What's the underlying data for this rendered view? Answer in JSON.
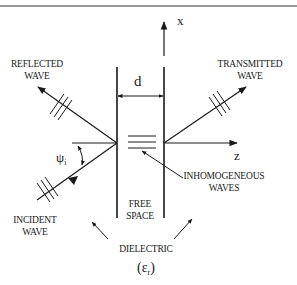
{
  "diagram": {
    "type": "wave-transmission-through-free-space-slab",
    "axes": {
      "x": "x",
      "z": "z"
    },
    "slab_width_label": "d",
    "labels": {
      "reflected": [
        "REFLECTED",
        "WAVE"
      ],
      "transmitted": [
        "TRANSMITTED",
        "WAVE"
      ],
      "incident": [
        "INCIDENT",
        "WAVE"
      ],
      "inhomogeneous": [
        "INHOMOGENEOUS",
        "WAVES"
      ],
      "free_space": [
        "FREE",
        "SPACE"
      ],
      "dielectric": "DIELECTRIC",
      "permittivity": "(εr)",
      "angle": "ψi"
    },
    "colors": {
      "line": "#1a1a1a",
      "background": "#ffffff"
    }
  }
}
